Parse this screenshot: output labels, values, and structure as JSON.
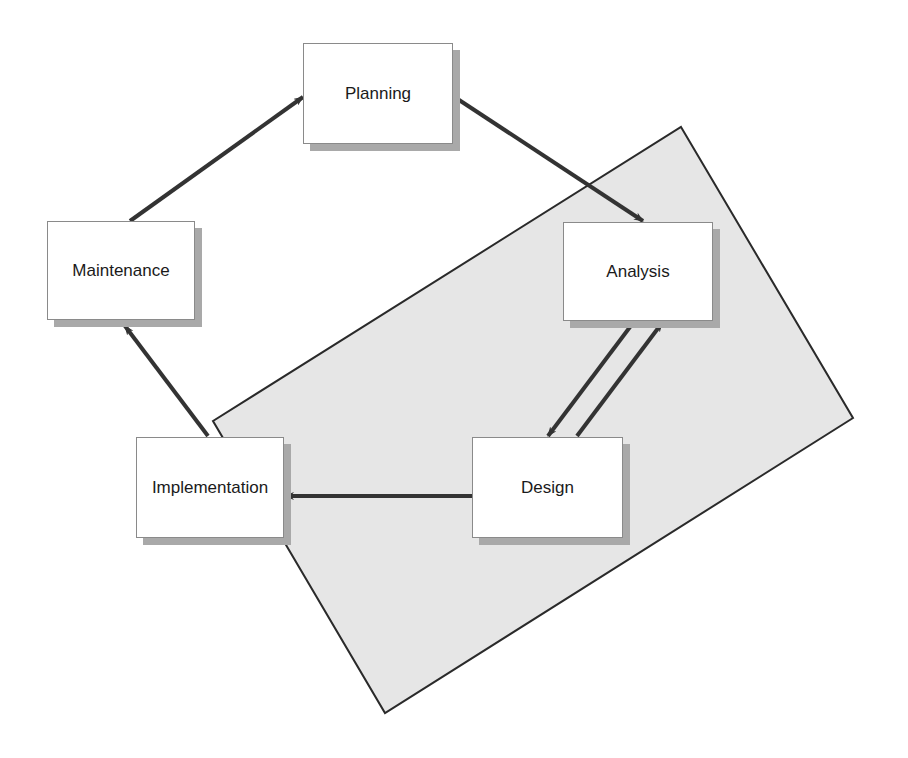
{
  "diagram": {
    "type": "cycle",
    "title": "",
    "colors": {
      "background": "#ffffff",
      "region_fill": "#e6e6e6",
      "region_stroke": "#2a2a2a",
      "node_fill": "#ffffff",
      "node_border": "#8a8a8a",
      "node_shadow": "#a9a9a9",
      "arrow": "#333333",
      "text": "#1a1a1a"
    },
    "region": {
      "name": "highlighted-phases",
      "points": [
        [
          681,
          127
        ],
        [
          853,
          418
        ],
        [
          385,
          713
        ],
        [
          213,
          421
        ]
      ]
    },
    "nodes": [
      {
        "id": "planning",
        "label": "Planning",
        "x": 303,
        "y": 43,
        "w": 150,
        "h": 101
      },
      {
        "id": "analysis",
        "label": "Analysis",
        "x": 563,
        "y": 222,
        "w": 150,
        "h": 99
      },
      {
        "id": "design",
        "label": "Design",
        "x": 472,
        "y": 437,
        "w": 151,
        "h": 101
      },
      {
        "id": "implementation",
        "label": "Implementation",
        "x": 136,
        "y": 437,
        "w": 148,
        "h": 101
      },
      {
        "id": "maintenance",
        "label": "Maintenance",
        "x": 47,
        "y": 221,
        "w": 148,
        "h": 99
      }
    ],
    "edges": [
      {
        "from": "maintenance",
        "to": "planning",
        "x1": 130,
        "y1": 221,
        "x2": 303,
        "y2": 97
      },
      {
        "from": "planning",
        "to": "analysis",
        "x1": 453,
        "y1": 96,
        "x2": 643,
        "y2": 221
      },
      {
        "from": "analysis",
        "to": "design",
        "x1": 633,
        "y1": 323,
        "x2": 548,
        "y2": 436
      },
      {
        "from": "design",
        "to": "analysis",
        "x1": 577,
        "y1": 436,
        "x2": 662,
        "y2": 323
      },
      {
        "from": "design",
        "to": "implementation",
        "x1": 472,
        "y1": 496,
        "x2": 285,
        "y2": 496
      },
      {
        "from": "implementation",
        "to": "maintenance",
        "x1": 208,
        "y1": 436,
        "x2": 125,
        "y2": 326
      }
    ]
  }
}
